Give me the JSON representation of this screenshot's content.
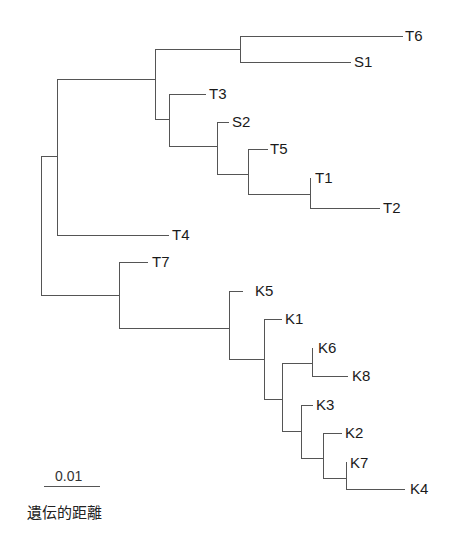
{
  "diagram": {
    "type": "phylogenetic-tree",
    "line_color": "#555555",
    "text_color": "#1a1a1a",
    "leaves": [
      {
        "label": "T6",
        "x": 403,
        "y": 36
      },
      {
        "label": "S1",
        "x": 351,
        "y": 62
      },
      {
        "label": "T3",
        "x": 206,
        "y": 94
      },
      {
        "label": "S2",
        "x": 229,
        "y": 122
      },
      {
        "label": "T5",
        "x": 268,
        "y": 149
      },
      {
        "label": "T1",
        "x": 310,
        "y": 178
      },
      {
        "label": "T2",
        "x": 380,
        "y": 208
      },
      {
        "label": "T4",
        "x": 169,
        "y": 235
      },
      {
        "label": "T7",
        "x": 148,
        "y": 262
      },
      {
        "label": "K5",
        "x": 243,
        "y": 291
      },
      {
        "label": "K1",
        "x": 282,
        "y": 319
      },
      {
        "label": "K6",
        "x": 312,
        "y": 348
      },
      {
        "label": "K8",
        "x": 348,
        "y": 376
      },
      {
        "label": "K3",
        "x": 313,
        "y": 405
      },
      {
        "label": "K2",
        "x": 342,
        "y": 433
      },
      {
        "label": "K7",
        "x": 346,
        "y": 462
      },
      {
        "label": "K4",
        "x": 405,
        "y": 489
      }
    ],
    "scale_bar": {
      "label": "0.01",
      "x1": 44,
      "x2": 100,
      "y": 486
    },
    "axis_title": "遺伝的距離"
  }
}
